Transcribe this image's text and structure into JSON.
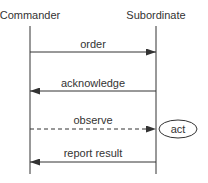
{
  "diagram": {
    "type": "sequence",
    "actors": [
      {
        "id": "commander",
        "label": "Commander"
      },
      {
        "id": "subordinate",
        "label": "Subordinate"
      }
    ],
    "messages": [
      {
        "label": "order",
        "from": "commander",
        "to": "subordinate",
        "style": "solid"
      },
      {
        "label": "acknowledge",
        "from": "subordinate",
        "to": "commander",
        "style": "solid"
      },
      {
        "label": "observe",
        "from": "commander",
        "to": "subordinate",
        "style": "dashed"
      },
      {
        "label": "report result",
        "from": "subordinate",
        "to": "commander",
        "style": "solid"
      }
    ],
    "activity": {
      "label": "act"
    },
    "colors": {
      "line": "#333333",
      "background": "#ffffff"
    }
  }
}
